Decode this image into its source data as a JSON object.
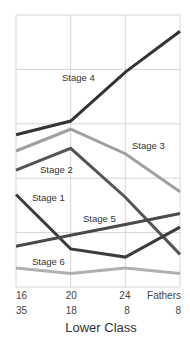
{
  "chart_data": {
    "type": "line",
    "title": "",
    "xlabel": "Lower Class",
    "ylabel": "",
    "categories": [
      "16",
      "20",
      "24",
      "Fathers"
    ],
    "category_counts": [
      "35",
      "18",
      "8",
      "8"
    ],
    "ylim": [
      0,
      100
    ],
    "grid": true,
    "legend": "inline labels",
    "series": [
      {
        "name": "Stage 4",
        "values": [
          56,
          61,
          79,
          94
        ],
        "color": "#333333",
        "label_pos": [
          62,
          81
        ]
      },
      {
        "name": "Stage 3",
        "values": [
          50,
          58,
          49,
          35
        ],
        "color": "#a0a0a0",
        "label_pos": [
          132,
          149
        ]
      },
      {
        "name": "Stage 2",
        "values": [
          43,
          51,
          33,
          12
        ],
        "color": "#555555",
        "label_pos": [
          40,
          173
        ]
      },
      {
        "name": "Stage 1",
        "values": [
          34,
          14,
          11,
          22
        ],
        "color": "#3c3c3c",
        "label_pos": [
          32,
          201
        ]
      },
      {
        "name": "Stage 5",
        "values": [
          15,
          19,
          23,
          27
        ],
        "color": "#4a4a4a",
        "label_pos": [
          83,
          222
        ]
      },
      {
        "name": "Stage 6",
        "values": [
          7,
          5,
          7,
          5
        ],
        "color": "#b0b0b0",
        "label_pos": [
          32,
          265
        ]
      }
    ]
  }
}
